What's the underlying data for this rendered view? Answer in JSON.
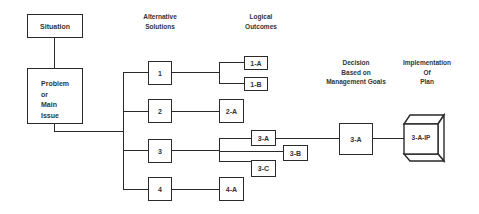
{
  "diagram": {
    "type": "decision-tree flowchart",
    "headers": {
      "alternative_solutions": [
        "Alternative",
        "Solutions"
      ],
      "logical_outcomes": [
        "Logical",
        "Outcomes"
      ],
      "decision": [
        "Decision",
        "Based on",
        "Management Goals"
      ],
      "implementation": [
        "Implementation",
        "Of",
        "Plan"
      ]
    },
    "nodes": {
      "situation": "Situation",
      "problem": [
        "Problem",
        "or",
        "Main",
        "Issue"
      ],
      "solutions": [
        "1",
        "2",
        "3",
        "4"
      ],
      "outcomes": {
        "o1a": "1-A",
        "o1b": "1-B",
        "o2a": "2-A",
        "o3a": "3-A",
        "o3b": "3-B",
        "o3c": "3-C",
        "o4a": "4-A"
      },
      "decision": "3-A",
      "implementation": "3-A-IP"
    },
    "edges": [
      [
        "Situation",
        "Problem or Main Issue"
      ],
      [
        "Problem or Main Issue",
        "1"
      ],
      [
        "Problem or Main Issue",
        "2"
      ],
      [
        "Problem or Main Issue",
        "3"
      ],
      [
        "Problem or Main Issue",
        "4"
      ],
      [
        "1",
        "1-A"
      ],
      [
        "1",
        "1-B"
      ],
      [
        "2",
        "2-A"
      ],
      [
        "3",
        "3-A"
      ],
      [
        "3",
        "3-B"
      ],
      [
        "3",
        "3-C"
      ],
      [
        "4",
        "4-A"
      ],
      [
        "3-A",
        "Decision 3-A"
      ],
      [
        "Decision 3-A",
        "3-A-IP"
      ]
    ],
    "colors": {
      "stroke": "#2a2a2a",
      "background": "#ffffff"
    }
  }
}
